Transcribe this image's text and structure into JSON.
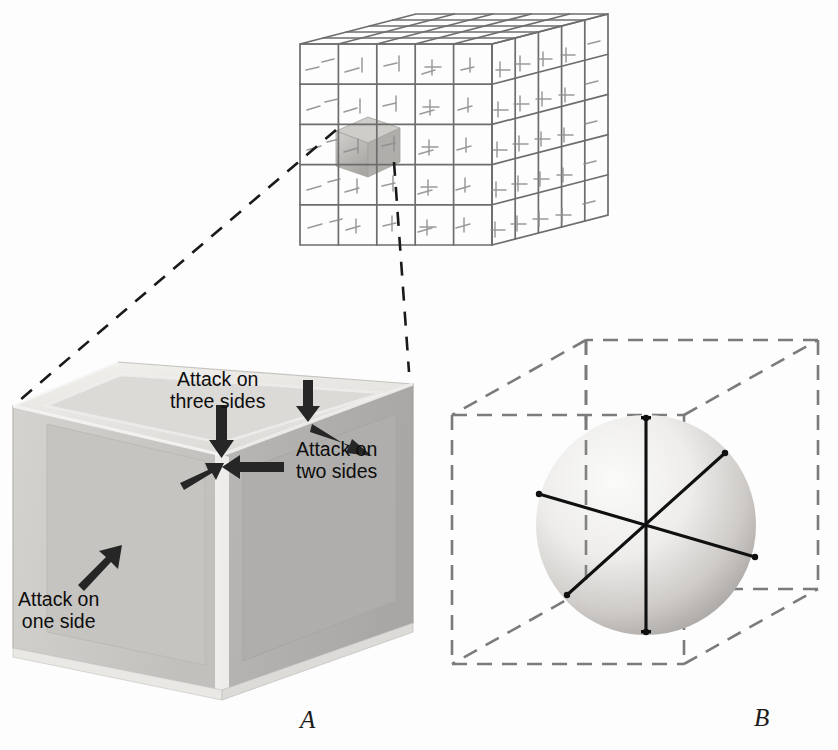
{
  "figure": {
    "background_color": "#fdfdfd",
    "panels": [
      {
        "id": "A",
        "label": "A",
        "caption_label": "A"
      },
      {
        "id": "B",
        "label": "B",
        "caption_label": "B"
      }
    ]
  },
  "annotations": {
    "attack_three": "Attack on\nthree sides",
    "attack_two": "Attack on\ntwo sides",
    "attack_one": "Attack on\none side"
  },
  "labels": {
    "panel_a": "A",
    "panel_b": "B"
  },
  "colors": {
    "ink": "#0d0d0d",
    "lattice_line": "#6b6b6b",
    "dash_line": "#7a7a7a",
    "leader_line": "#1a1a1a",
    "cube_top": "#e8e6e2",
    "cube_left": "#c9c7c4",
    "cube_right": "#b4b2b0",
    "cube_frame": "#efeeec",
    "sphere_light": "#f2f1ef",
    "sphere_dark": "#9a9896",
    "highlight_cell": "#b9b7b4"
  },
  "lattice": {
    "divisions": 5,
    "highlighted_cell": {
      "col": 1,
      "row": 2,
      "layer": 0
    }
  },
  "sphere_axes": {
    "count": 3,
    "half_axes": 6,
    "center": [
      646,
      525
    ],
    "radius": 110
  }
}
